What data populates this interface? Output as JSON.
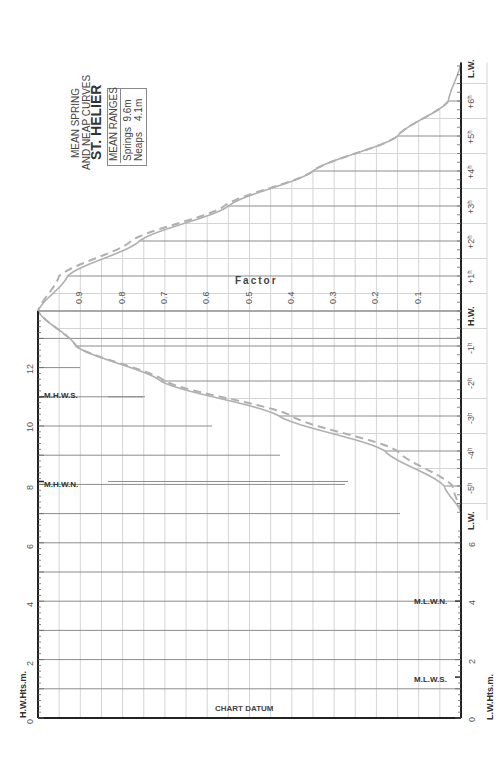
{
  "chart_data": {
    "type": "line",
    "title": "ST. HELIER",
    "subtitle": [
      "MEAN SPRING",
      "AND NEAP CURVES"
    ],
    "orientation": "rotated-90",
    "legend": {
      "header": "MEAN RANGES",
      "entries": [
        {
          "name": "Springs",
          "value": "9.6m",
          "style": "solid"
        },
        {
          "name": "Neaps",
          "value": "4.1m",
          "style": "dashed"
        }
      ]
    },
    "time_axis": {
      "labels": [
        "L.W.",
        "-5h",
        "-4h",
        "-3h",
        "-2h",
        "-1h",
        "H.W.",
        "+1h",
        "+2h",
        "+3h",
        "+4h",
        "+5h",
        "+6h",
        "L.W."
      ],
      "x": [
        -5.75,
        -5,
        -4,
        -3,
        -2,
        -1,
        0,
        1,
        2,
        3,
        4,
        5,
        6,
        7.1
      ]
    },
    "factor_axis": {
      "label": "Factor",
      "ticks": [
        0.9,
        0.8,
        0.7,
        0.6,
        0.5,
        0.4,
        0.3,
        0.2,
        0.1
      ],
      "range": [
        0,
        1
      ]
    },
    "hw_height_axis": {
      "label": "H.W.Hts.m.",
      "ticks": [
        0,
        2,
        4,
        6,
        8,
        10,
        12
      ],
      "range": [
        0,
        13.5
      ]
    },
    "lw_height_axis": {
      "label": "L.W.Hts.m.",
      "ticks": [
        0,
        2,
        4,
        6
      ],
      "range": [
        0,
        6.8
      ]
    },
    "annotations": {
      "mhws": {
        "label": "M.H.W.S.",
        "value": 11.0
      },
      "mhwn": {
        "label": "M.H.W.N.",
        "value": 8.1
      },
      "mlwn": {
        "label": "M.L.W.N.",
        "value": 4.0
      },
      "mlws": {
        "label": "M.L.W.S.",
        "value": 1.4
      },
      "chart_datum": "CHART DATUM"
    },
    "series": [
      {
        "name": "Springs",
        "x": [
          -5.75,
          -5,
          -4,
          -3,
          -2,
          -1,
          0,
          1,
          2,
          3,
          4,
          5,
          6,
          7.1
        ],
        "values": [
          0.0,
          0.04,
          0.18,
          0.43,
          0.71,
          0.91,
          1.0,
          0.93,
          0.76,
          0.55,
          0.35,
          0.15,
          0.03,
          0.0
        ]
      },
      {
        "name": "Neaps",
        "x": [
          -5.75,
          -5,
          -4,
          -3,
          -2,
          -1,
          0,
          1,
          2,
          3,
          4,
          5,
          6
        ],
        "values": [
          0.0,
          0.02,
          0.15,
          0.4,
          0.7,
          0.91,
          1.0,
          0.95,
          0.78,
          0.56,
          0.35,
          0.15,
          0.03
        ]
      }
    ]
  },
  "labels": {
    "title": "ST. HELIER",
    "subtitle_line1": "MEAN SPRING",
    "subtitle_line2": "AND NEAP CURVES",
    "legend_header": "MEAN RANGES",
    "legend_springs": "Springs  9.6m",
    "legend_neaps": "Neaps    4.1m",
    "factor": "Factor",
    "hw_hts": "H.W.Hts.m.",
    "lw_hts": "L.W.Hts.m.",
    "chart_datum": "CHART DATUM",
    "mhws": "M.H.W.S.",
    "mhwn": "M.H.W.N.",
    "mlwn": "M.L.W.N.",
    "mlws": "M.L.W.S.",
    "lw": "L.W.",
    "hw": "H.W."
  },
  "colors": {
    "curve": "#b0b0b0",
    "grid": "#d4d4d4",
    "grid_major": "#8c8c8c",
    "axis": "#222222",
    "text": "#333333"
  }
}
